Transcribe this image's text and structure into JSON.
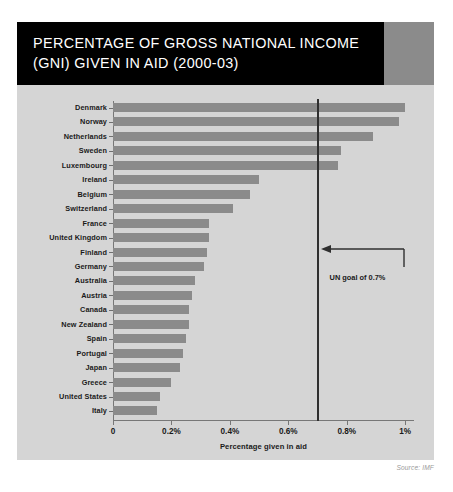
{
  "title": "PERCENTAGE OF GROSS NATIONAL INCOME\n(GNI) GIVEN IN AID (2000-03)",
  "source": "Source: IMF",
  "annotation": {
    "label": "UN goal of 0.7%",
    "value": 0.7
  },
  "colors": {
    "title_background": "#000000",
    "title_text": "#ffffff",
    "panel_background": "#d5d5d5",
    "bar": "#8b8b8b",
    "axis": "#777777",
    "goal_line": "#2f2f2f",
    "source_text": "#9a9a9a"
  },
  "chart_data": {
    "type": "bar",
    "orientation": "horizontal",
    "title": "PERCENTAGE OF GROSS NATIONAL INCOME (GNI) GIVEN IN AID (2000-03)",
    "xlabel": "Percentage given in aid",
    "ylabel": "",
    "xlim": [
      0,
      1.03
    ],
    "grid": false,
    "legend": null,
    "xticks": [
      0,
      0.2,
      0.4,
      0.6,
      0.8,
      1.0
    ],
    "xticklabels": [
      "0",
      "0.2%",
      "0.4%",
      "0.6%",
      "0.8%",
      "1%"
    ],
    "categories": [
      "Denmark",
      "Norway",
      "Netherlands",
      "Sweden",
      "Luxembourg",
      "Ireland",
      "Belgium",
      "Switzerland",
      "France",
      "United Kingdom",
      "Finland",
      "Germany",
      "Australia",
      "Austria",
      "Canada",
      "New Zealand",
      "Spain",
      "Portugal",
      "Japan",
      "Greece",
      "United States",
      "Italy"
    ],
    "values": [
      1.0,
      0.98,
      0.89,
      0.78,
      0.77,
      0.5,
      0.47,
      0.41,
      0.33,
      0.33,
      0.32,
      0.31,
      0.28,
      0.27,
      0.26,
      0.26,
      0.25,
      0.24,
      0.23,
      0.2,
      0.16,
      0.15
    ],
    "annotations": [
      {
        "text": "UN goal of 0.7%",
        "x": 0.7,
        "type": "vline-with-arrow"
      }
    ]
  }
}
